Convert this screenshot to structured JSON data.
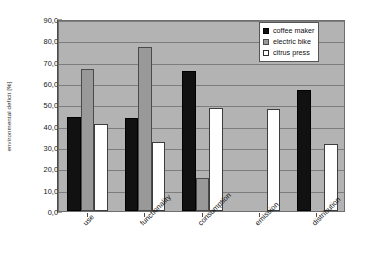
{
  "title_strip": {
    "text": "environmental deficit"
  },
  "chart_data": {
    "type": "bar",
    "title": "",
    "xlabel": "",
    "ylabel": "environmental deficit [%]",
    "ylim": [
      0,
      90
    ],
    "ytick_step": 10,
    "ytick_labels": [
      "0,0",
      "10,0",
      "20,0",
      "30,0",
      "40,0",
      "50,0",
      "60,0",
      "70,0",
      "80,0",
      "90,0"
    ],
    "ytick_values": [
      0,
      10,
      20,
      30,
      40,
      50,
      60,
      70,
      80,
      90
    ],
    "grid": true,
    "grid_axis": "y",
    "legend_position": "top-right",
    "categories": [
      "use",
      "functionality",
      "consumption",
      "emission",
      "distribution"
    ],
    "series": [
      {
        "name": "coffee maker",
        "color": "#111111",
        "values": [
          44.0,
          43.5,
          65.5,
          0.0,
          56.5
        ]
      },
      {
        "name": "electric bike",
        "color": "#999999",
        "values": [
          66.5,
          77.0,
          15.5,
          0.0,
          0.0
        ]
      },
      {
        "name": "citrus press",
        "color": "#ffffff",
        "values": [
          41.0,
          32.5,
          48.5,
          48.0,
          31.5
        ]
      }
    ],
    "plot_background": "#b3b3b3",
    "gridline_color": "#7d7d7d",
    "axis_color": "#4a4a4a"
  }
}
